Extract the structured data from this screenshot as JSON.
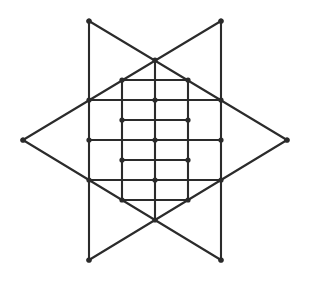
{
  "figure": {
    "name": "triangular-lattice-hexagram",
    "background_color": "#ffffff",
    "line_color": "#2b2b2b",
    "vertex_color": "#2b2b2b",
    "line_width": 2.1,
    "vertex_radius": 2.6,
    "canvas": {
      "width": 310,
      "height": 281
    }
  },
  "chart_data": {
    "type": "scatter",
    "title": "",
    "xlabel": "",
    "ylabel": "",
    "xlim": [
      0,
      310
    ],
    "ylim": [
      0,
      281
    ],
    "grid": false,
    "legend": null,
    "geometry": {
      "grid_spacing_x": 33,
      "grid_spacing_y": 40,
      "columns_x": [
        89,
        122,
        155,
        188,
        221
      ],
      "rows_y": [
        21,
        60,
        100,
        140,
        180,
        220,
        260
      ],
      "star_points": [
        {
          "name": "top-left-point",
          "x": 89,
          "y": 21
        },
        {
          "name": "top-right-point",
          "x": 221,
          "y": 21
        },
        {
          "name": "right-point",
          "x": 287,
          "y": 140
        },
        {
          "name": "bottom-right-point",
          "x": 221,
          "y": 260
        },
        {
          "name": "bottom-left-point",
          "x": 89,
          "y": 260
        },
        {
          "name": "left-point",
          "x": 23,
          "y": 140
        }
      ]
    },
    "vertices": [
      {
        "x": 89,
        "y": 21
      },
      {
        "x": 221,
        "y": 21
      },
      {
        "x": 155,
        "y": 60
      },
      {
        "x": 122,
        "y": 80
      },
      {
        "x": 188,
        "y": 80
      },
      {
        "x": 89,
        "y": 100
      },
      {
        "x": 155,
        "y": 100
      },
      {
        "x": 221,
        "y": 100
      },
      {
        "x": 23,
        "y": 140
      },
      {
        "x": 122,
        "y": 120
      },
      {
        "x": 188,
        "y": 120
      },
      {
        "x": 89,
        "y": 140
      },
      {
        "x": 155,
        "y": 140
      },
      {
        "x": 221,
        "y": 140
      },
      {
        "x": 287,
        "y": 140
      },
      {
        "x": 122,
        "y": 160
      },
      {
        "x": 188,
        "y": 160
      },
      {
        "x": 89,
        "y": 180
      },
      {
        "x": 155,
        "y": 180
      },
      {
        "x": 221,
        "y": 180
      },
      {
        "x": 122,
        "y": 200
      },
      {
        "x": 188,
        "y": 200
      },
      {
        "x": 155,
        "y": 220
      },
      {
        "x": 89,
        "y": 260
      },
      {
        "x": 221,
        "y": 260
      }
    ],
    "edges": [
      {
        "x1": 89,
        "y1": 21,
        "x2": 89,
        "y2": 260
      },
      {
        "x1": 221,
        "y1": 21,
        "x2": 221,
        "y2": 260
      },
      {
        "x1": 122,
        "y1": 80,
        "x2": 122,
        "y2": 200
      },
      {
        "x1": 188,
        "y1": 80,
        "x2": 188,
        "y2": 200
      },
      {
        "x1": 155,
        "y1": 60,
        "x2": 155,
        "y2": 220
      },
      {
        "x1": 89,
        "y1": 21,
        "x2": 287,
        "y2": 140
      },
      {
        "x1": 221,
        "y1": 21,
        "x2": 23,
        "y2": 140
      },
      {
        "x1": 23,
        "y1": 140,
        "x2": 221,
        "y2": 260
      },
      {
        "x1": 287,
        "y1": 140,
        "x2": 89,
        "y2": 260
      },
      {
        "x1": 89,
        "y1": 100,
        "x2": 221,
        "y2": 100
      },
      {
        "x1": 89,
        "y1": 180,
        "x2": 221,
        "y2": 180
      },
      {
        "x1": 122,
        "y1": 80,
        "x2": 188,
        "y2": 80
      },
      {
        "x1": 122,
        "y1": 200,
        "x2": 188,
        "y2": 200
      },
      {
        "x1": 89,
        "y1": 140,
        "x2": 221,
        "y2": 140
      },
      {
        "x1": 122,
        "y1": 120,
        "x2": 188,
        "y2": 120
      },
      {
        "x1": 122,
        "y1": 160,
        "x2": 188,
        "y2": 160
      }
    ]
  }
}
